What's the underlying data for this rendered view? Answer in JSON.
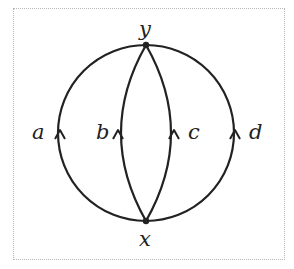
{
  "diagram": {
    "vertices": [
      {
        "id": "y",
        "label": "y",
        "position": "top"
      },
      {
        "id": "x",
        "label": "x",
        "position": "bottom"
      }
    ],
    "edges": [
      {
        "id": "a",
        "label": "a",
        "from": "x",
        "to": "y",
        "style": "outer-left-arc"
      },
      {
        "id": "b",
        "label": "b",
        "from": "x",
        "to": "y",
        "style": "inner-left-arc"
      },
      {
        "id": "c",
        "label": "c",
        "from": "x",
        "to": "y",
        "style": "inner-right-arc"
      },
      {
        "id": "d",
        "label": "d",
        "from": "x",
        "to": "y",
        "style": "outer-right-arc"
      }
    ],
    "stroke_color": "#222222"
  }
}
